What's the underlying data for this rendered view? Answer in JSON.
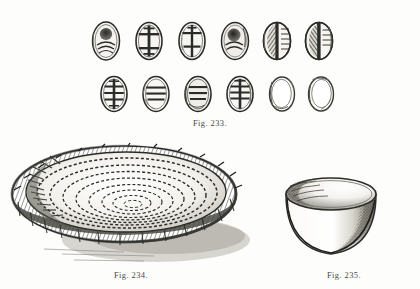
{
  "page": {
    "background_color": "#fdfdfc",
    "ink_color": "#2b2b28",
    "medium": "engraving",
    "width": 420,
    "height": 289
  },
  "figures": [
    {
      "id": "fig-233",
      "caption": "Fig. 233.",
      "subject": "gaming dice",
      "description": "Two rows of six oval carved dice with incised face markings",
      "caption_position": {
        "x": 186,
        "y": 118
      },
      "rows": [
        {
          "row_index": 0,
          "y": 18,
          "items": [
            {
              "index": 0,
              "x": 88,
              "marking": "filled-oval-with-arcs",
              "shaded": true
            },
            {
              "index": 1,
              "x": 131,
              "marking": "cross-with-bar-ends",
              "shaded": false
            },
            {
              "index": 2,
              "x": 174,
              "marking": "cross-with-bar-ends",
              "shaded": false
            },
            {
              "index": 3,
              "x": 217,
              "marking": "filled-blob-with-arcs",
              "shaded": true
            },
            {
              "index": 4,
              "x": 259,
              "marking": "split-hatched-panels",
              "shaded": true
            },
            {
              "index": 5,
              "x": 301,
              "marking": "split-hatched-panels",
              "shaded": true
            }
          ]
        },
        {
          "row_index": 1,
          "y": 73,
          "items": [
            {
              "index": 0,
              "x": 96,
              "marking": "ladder-vertical-rungs",
              "shaded": false
            },
            {
              "index": 1,
              "x": 138,
              "marking": "horizontal-rungs",
              "shaded": false
            },
            {
              "index": 2,
              "x": 180,
              "marking": "horizontal-rungs",
              "shaded": true
            },
            {
              "index": 3,
              "x": 222,
              "marking": "ladder-vertical-rungs",
              "shaded": false
            },
            {
              "index": 4,
              "x": 264,
              "marking": "plain",
              "shaded": false
            },
            {
              "index": 5,
              "x": 303,
              "marking": "plain",
              "shaded": false
            }
          ]
        }
      ]
    },
    {
      "id": "fig-234",
      "caption": "Fig. 234.",
      "subject": "coiled basket tray",
      "description": "Shallow woven coiled basket tray seen in three-quarter view with cast shadow",
      "caption_position": {
        "x": 105,
        "y": 272
      },
      "coil_rings": 9
    },
    {
      "id": "fig-235",
      "caption": "Fig. 235.",
      "subject": "pottery cup",
      "description": "Plain round-bottomed ceramic cup with stippled shading on interior and right side",
      "caption_position": {
        "x": 318,
        "y": 272
      }
    }
  ]
}
